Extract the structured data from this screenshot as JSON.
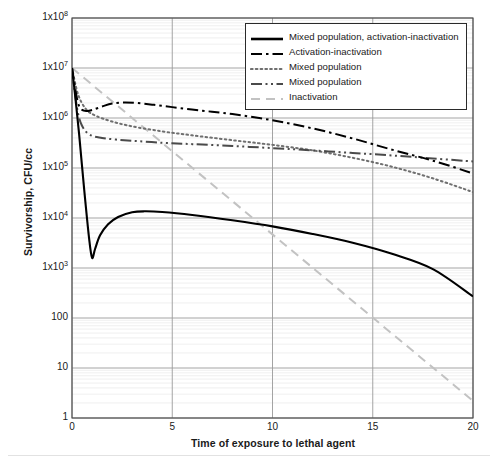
{
  "chart_data": {
    "type": "line",
    "title": "",
    "xlabel": "Time of exposure to lethal agent",
    "ylabel": "Survivorship, CFU/cc",
    "yscale": "log",
    "xlim": [
      0,
      20
    ],
    "ylim": [
      1,
      100000000
    ],
    "grid": true,
    "legend_position": "top-right",
    "xticks": [
      "0",
      "5",
      "10",
      "15",
      "20"
    ],
    "xtick_values": [
      0,
      5,
      10,
      15,
      20
    ],
    "yticks": [
      "1",
      "10",
      "100",
      "1x10^3",
      "1x10^4",
      "1x10^5",
      "1x10^6",
      "1x10^7",
      "1x10^8"
    ],
    "ytick_values": [
      1,
      10,
      100,
      1000,
      10000,
      100000,
      1000000,
      10000000,
      100000000
    ],
    "series": [
      {
        "name": "Mixed population, activation-inactivation",
        "style": "solid",
        "color": "#000000",
        "width": 2.1,
        "x": [
          0,
          0.15,
          0.35,
          0.6,
          0.85,
          1.0,
          1.15,
          1.4,
          1.8,
          2.3,
          3.0,
          3.6,
          4.5,
          6.0,
          8.0,
          10.0,
          12.0,
          14.0,
          16.0,
          18.0,
          20.0
        ],
        "y": [
          10000000,
          3000000,
          500000,
          40000,
          4000,
          1600,
          2400,
          4500,
          7500,
          10500,
          13000,
          13600,
          13200,
          11500,
          9000,
          6800,
          4800,
          3200,
          1900,
          950,
          270
        ]
      },
      {
        "name": "Activation-inactivation",
        "style": "dash-dot",
        "color": "#000000",
        "width": 2.0,
        "x": [
          0,
          0.3,
          0.6,
          1.0,
          1.5,
          2.0,
          2.6,
          3.2,
          4.0,
          5.0,
          6.5,
          8.0,
          10.0,
          12.0,
          14.0,
          16.0,
          18.0,
          20.0
        ],
        "y": [
          10000000,
          2000000,
          1400000,
          1450000,
          1700000,
          1950000,
          2050000,
          2000000,
          1850000,
          1650000,
          1400000,
          1200000,
          900000,
          620000,
          390000,
          230000,
          140000,
          78000
        ]
      },
      {
        "name": "Mixed population",
        "style": "dotted",
        "color": "#6f6f6f",
        "width": 2.0,
        "x": [
          0,
          0.3,
          0.7,
          1.2,
          2.0,
          3.0,
          4.5,
          6.0,
          8.0,
          10.0,
          12.0,
          14.0,
          16.0,
          18.0,
          20.0
        ],
        "y": [
          10000000,
          3000000,
          1500000,
          1100000,
          850000,
          680000,
          540000,
          450000,
          360000,
          290000,
          225000,
          160000,
          105000,
          62000,
          33000
        ]
      },
      {
        "name": "Mixed population",
        "style": "dash-dot-dot",
        "color": "#4a4a4a",
        "width": 2.0,
        "x": [
          0,
          0.25,
          0.5,
          0.9,
          1.5,
          2.2,
          3.0,
          4.5,
          6.0,
          8.0,
          10.0,
          12.0,
          14.0,
          16.0,
          18.0,
          20.0
        ],
        "y": [
          10000000,
          1600000,
          700000,
          460000,
          400000,
          370000,
          350000,
          320000,
          300000,
          275000,
          250000,
          225000,
          200000,
          178000,
          155000,
          135000
        ]
      },
      {
        "name": "Inactivation",
        "style": "dashed",
        "color": "#c2c2c2",
        "width": 2.0,
        "x": [
          0,
          20
        ],
        "y": [
          10000000,
          2.2
        ]
      }
    ]
  },
  "legend": {
    "items": [
      {
        "label": "Mixed population, activation-inactivation",
        "style": "solid",
        "color": "#000000"
      },
      {
        "label": "Activation-inactivation",
        "style": "dash-dot",
        "color": "#000000"
      },
      {
        "label": "Mixed population",
        "style": "dotted",
        "color": "#6f6f6f"
      },
      {
        "label": "Mixed population",
        "style": "dash-dot-dot",
        "color": "#4a4a4a"
      },
      {
        "label": "Inactivation",
        "style": "dashed",
        "color": "#c2c2c2"
      }
    ]
  },
  "axes": {
    "y_title": "Survivorship, CFU/cc",
    "x_title": "Time of exposure to lethal agent",
    "ytick_labels": [
      {
        "mantissa": "1x10",
        "exp": "8"
      },
      {
        "mantissa": "1x10",
        "exp": "7"
      },
      {
        "mantissa": "1x10",
        "exp": "6"
      },
      {
        "mantissa": "1x10",
        "exp": "5"
      },
      {
        "mantissa": "1x10",
        "exp": "4"
      },
      {
        "mantissa": "1x10",
        "exp": "3"
      },
      {
        "mantissa": "100",
        "exp": ""
      },
      {
        "mantissa": "10",
        "exp": ""
      },
      {
        "mantissa": "1",
        "exp": ""
      }
    ],
    "xtick_labels": [
      "0",
      "5",
      "10",
      "15",
      "20"
    ]
  },
  "colors": {
    "axis": "#4a4a4a",
    "major_grid": "#9a9a9a",
    "minor_grid": "#e8e8e8",
    "text": "#1a1a1a",
    "background": "#ffffff"
  }
}
